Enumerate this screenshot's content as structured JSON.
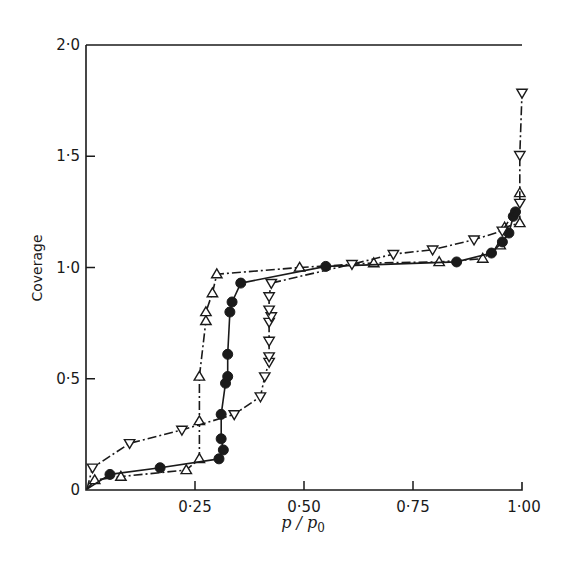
{
  "chart_data": {
    "type": "line",
    "title": "",
    "xlabel": "p/p0",
    "xlabel_parts": {
      "main": "p / p",
      "subscript": "0"
    },
    "ylabel": "Coverage",
    "xlim": [
      0,
      1.0
    ],
    "ylim": [
      0,
      2.0
    ],
    "x_ticks": [
      0.25,
      0.5,
      0.75,
      1.0
    ],
    "x_tick_labels": [
      "0·25",
      "0·50",
      "0·75",
      "1·00"
    ],
    "y_ticks": [
      0,
      0.5,
      1.0,
      1.5,
      2.0
    ],
    "y_tick_labels": [
      "0",
      "0·5",
      "1·0",
      "1·5",
      "2·0"
    ],
    "grid": false,
    "legend": "none",
    "series": [
      {
        "name": "open triangles (up)",
        "marker": "triangle-up",
        "filled": false,
        "line_style": "dash-dot",
        "x": [
          0.02,
          0.08,
          0.23,
          0.26,
          0.26,
          0.26,
          0.275,
          0.275,
          0.29,
          0.3,
          0.49,
          0.66,
          0.81,
          0.91,
          0.95,
          0.96,
          0.995,
          0.995
        ],
        "y": [
          0.045,
          0.06,
          0.09,
          0.14,
          0.31,
          0.51,
          0.76,
          0.8,
          0.885,
          0.97,
          1.0,
          1.02,
          1.025,
          1.04,
          1.1,
          1.18,
          1.2,
          1.335
        ]
      },
      {
        "name": "filled circles",
        "marker": "circle",
        "filled": true,
        "line_style": "solid",
        "x": [
          0.055,
          0.17,
          0.305,
          0.315,
          0.31,
          0.31,
          0.32,
          0.325,
          0.325,
          0.33,
          0.335,
          0.355,
          0.55,
          0.85,
          0.93,
          0.955,
          0.97,
          0.98,
          0.985
        ],
        "y": [
          0.07,
          0.1,
          0.14,
          0.18,
          0.23,
          0.34,
          0.48,
          0.51,
          0.61,
          0.8,
          0.845,
          0.93,
          1.005,
          1.025,
          1.065,
          1.115,
          1.155,
          1.23,
          1.25
        ]
      },
      {
        "name": "open triangles (down)",
        "marker": "triangle-down",
        "filled": false,
        "line_style": "dash-dot",
        "x": [
          0.015,
          0.1,
          0.22,
          0.34,
          0.4,
          0.41,
          0.42,
          0.42,
          0.42,
          0.42,
          0.425,
          0.42,
          0.42,
          0.425,
          0.61,
          0.705,
          0.795,
          0.89,
          0.955,
          0.995,
          0.995,
          1.0
        ],
        "y": [
          0.1,
          0.21,
          0.27,
          0.34,
          0.42,
          0.51,
          0.575,
          0.6,
          0.67,
          0.755,
          0.78,
          0.81,
          0.87,
          0.93,
          1.015,
          1.06,
          1.08,
          1.125,
          1.165,
          1.29,
          1.505,
          1.785
        ]
      }
    ]
  },
  "plot": {
    "px_left": 86,
    "px_right": 522,
    "px_top": 45,
    "px_bottom": 490,
    "ink_color": "#1a1a1a",
    "background": "#ffffff"
  }
}
